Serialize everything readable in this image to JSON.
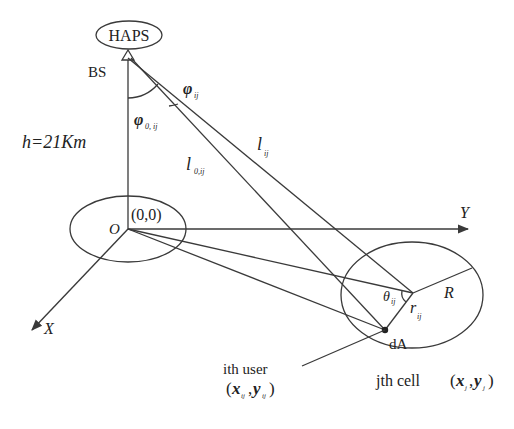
{
  "labels": {
    "haps": "HAPS",
    "bs": "BS",
    "phi": "φ",
    "phi_sub": "ij",
    "phi0": "φ",
    "phi0_sub": "0, ij",
    "height": "h=21Km",
    "l": "l",
    "l_sub": "ij",
    "l0": "l",
    "l0_sub": "0,ij",
    "origin_coord": "(0,0)",
    "origin": "O",
    "x_axis": "X",
    "y_axis": "Y",
    "theta": "θ",
    "theta_sub": "ij",
    "r": "r",
    "r_sub": "ij",
    "radius": "R",
    "dA": "dA",
    "user_line1": "ith user",
    "user_x": "x",
    "user_x_sub": "ij",
    "user_y": "y",
    "user_y_sub": "ij",
    "cell_prefix": "jth  cell",
    "cell_x": "x",
    "cell_x_sub": "j",
    "cell_y": "y",
    "cell_y_sub": "j"
  },
  "colors": {
    "line": "#3a3a3a",
    "text": "#222222",
    "background": "#ffffff"
  }
}
